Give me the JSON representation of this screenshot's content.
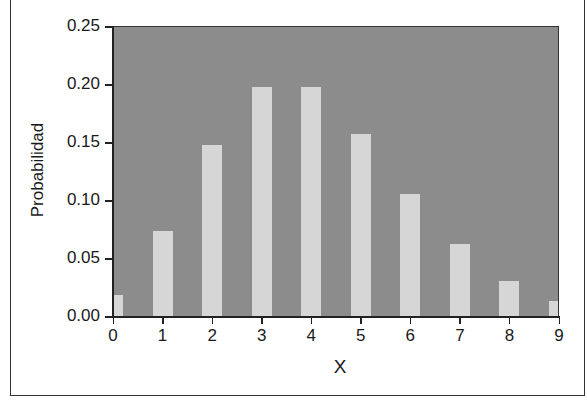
{
  "chart_data": {
    "type": "bar",
    "title": "",
    "xlabel": "X",
    "ylabel": "Probabilidad",
    "categories": [
      "0",
      "1",
      "2",
      "3",
      "4",
      "5",
      "6",
      "7",
      "8",
      "9"
    ],
    "values": [
      0.018,
      0.073,
      0.147,
      0.197,
      0.197,
      0.157,
      0.105,
      0.062,
      0.03,
      0.013
    ],
    "ylim": [
      0,
      0.25
    ],
    "xlim": [
      0,
      9
    ],
    "yticks": [
      "0.00",
      "0.05",
      "0.10",
      "0.15",
      "0.20",
      "0.25"
    ],
    "xticks": [
      "0",
      "1",
      "2",
      "3",
      "4",
      "5",
      "6",
      "7",
      "8",
      "9"
    ],
    "grid": false,
    "legend": null,
    "colors": {
      "plot_background": "#8c8c8c",
      "bar": "#d6d6d6"
    }
  }
}
